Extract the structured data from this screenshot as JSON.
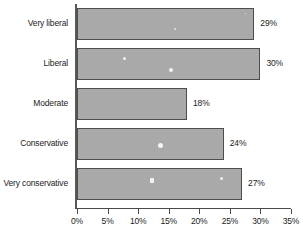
{
  "chart_data": {
    "type": "bar",
    "orientation": "horizontal",
    "title": "",
    "subtitle": "",
    "xlabel": "",
    "ylabel": "",
    "categories": [
      "Very liberal",
      "Liberal",
      "Moderate",
      "Conservative",
      "Very conservative"
    ],
    "values": [
      29,
      30,
      18,
      24,
      27
    ],
    "value_labels": [
      "29%",
      "30%",
      "18%",
      "24%",
      "27%"
    ],
    "xlim": [
      0,
      35
    ],
    "xticks": [
      0,
      5,
      10,
      15,
      20,
      25,
      30,
      35
    ],
    "xtick_labels": [
      "0%",
      "5%",
      "10%",
      "15%",
      "20%",
      "25%",
      "30%",
      "35%"
    ],
    "grid": false,
    "legend": false,
    "legend_position": "none",
    "bar_color": "#a9a9a9",
    "bar_border_color": "#4d4d4d",
    "axis_color": "#4a4a4a",
    "text_color": "#1b1b1b",
    "background_color": "#ffffff"
  }
}
